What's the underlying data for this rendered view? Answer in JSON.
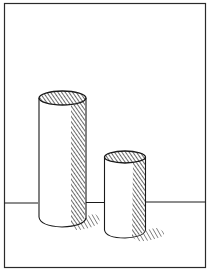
{
  "illustration": {
    "title": "Two cylinders on a table",
    "style": "pen-and-ink hatching",
    "colors": {
      "ink": "#1a1a1a",
      "paper": "#ffffff",
      "frame": "#2a2a2a"
    },
    "frame": {
      "x": 4,
      "y": 3,
      "width": 202,
      "height": 265
    },
    "horizon_y": 203,
    "objects": [
      {
        "name": "tall-cylinder",
        "left": 38,
        "right": 86,
        "top_y": 98,
        "bottom_y": 222
      },
      {
        "name": "short-cylinder",
        "left": 104,
        "right": 146,
        "top_y": 157,
        "bottom_y": 235
      }
    ]
  }
}
